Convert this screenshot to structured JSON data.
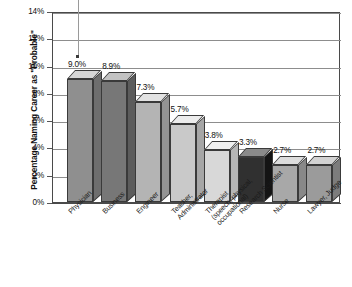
{
  "chart_data": {
    "type": "bar",
    "title": "",
    "xlabel": "",
    "ylabel": "Percentage Naming Career as \"Probable\"",
    "ylim": [
      0,
      14
    ],
    "ytick_labels": [
      "0%",
      "2%",
      "4%",
      "6%",
      "8%",
      "10%",
      "12%",
      "14%"
    ],
    "ytick_values": [
      0,
      2,
      4,
      6,
      8,
      10,
      12,
      14
    ],
    "grid": true,
    "legend": "none",
    "categories": [
      "Physician",
      "Business",
      "Engineer",
      "Teacher,\nAdministrator",
      "Therapist\n(speech, physical,\noccupational)",
      "Research Scientist",
      "Nurse",
      "Lawyer, Judge"
    ],
    "values": [
      9.0,
      8.9,
      7.3,
      5.7,
      3.8,
      3.3,
      2.7,
      2.7
    ],
    "data_labels": [
      "9.0%",
      "8.9%",
      "7.3%",
      "5.7%",
      "3.8%",
      "3.3%",
      "2.7%",
      "2.7%"
    ],
    "bar_colors": [
      "#8f8f8f",
      "#777777",
      "#b4b4b4",
      "#c9c9c9",
      "#d8d8d8",
      "#303030",
      "#a8a8a8",
      "#9b9b9b"
    ],
    "bar_top_colors": [
      "#d6d6d6",
      "#c2c2c2",
      "#e2e2e2",
      "#ececec",
      "#f0f0f0",
      "#8a8a8a",
      "#dcdcdc",
      "#d2d2d2"
    ],
    "bar_side_colors": [
      "#6e6e6e",
      "#5c5c5c",
      "#949494",
      "#a6a6a6",
      "#b6b6b6",
      "#141414",
      "#888888",
      "#7c7c7c"
    ]
  },
  "annotation": {
    "stray_line": "vertical-line-marker"
  }
}
